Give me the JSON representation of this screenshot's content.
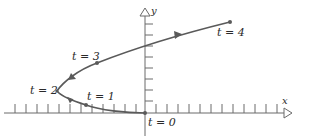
{
  "diagram": {
    "type": "parametric-curve",
    "axes": {
      "x_label": "x",
      "y_label": "y",
      "origin_px": [
        145,
        113
      ],
      "tick_spacing_px": 11
    },
    "points": [
      {
        "t": 0,
        "label": "t = 0",
        "px": [
          145,
          113
        ]
      },
      {
        "t": 1,
        "label": "t = 1",
        "px": [
          86,
          105
        ]
      },
      {
        "t": 2,
        "label": "t = 2",
        "px": [
          57,
          91
        ]
      },
      {
        "t": 3,
        "label": "t = 3",
        "px": [
          97,
          63
        ]
      },
      {
        "t": 4,
        "label": "t = 4",
        "px": [
          230,
          22
        ]
      }
    ],
    "direction_arrows": [
      {
        "px": [
          70,
          100
        ],
        "direction": "toward t=2"
      },
      {
        "px": [
          72,
          77
        ],
        "direction": "toward t=3"
      },
      {
        "px": [
          177,
          35
        ],
        "direction": "toward t=4"
      }
    ],
    "colors": {
      "curve": "#5a5a5a",
      "axis": "#6a6a6a",
      "text": "#2a2a2a"
    }
  }
}
